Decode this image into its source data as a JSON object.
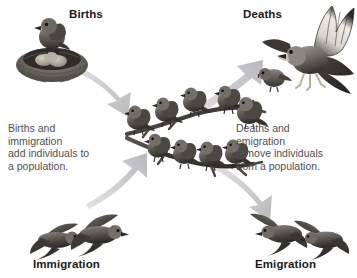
{
  "diagram": {
    "background_color": "#ffffff",
    "text_color": "#4f4f52",
    "heading_color": "#1a1a1a",
    "arrow_color": "#c6c6c8"
  },
  "labels": {
    "births": "Births",
    "deaths": "Deaths",
    "immigration": "Immigration",
    "emigration": "Emigration"
  },
  "captions": {
    "left": "Births and\nimmigration\nadd individuals to\na population.",
    "right": "Deaths and\nemigration\nremove individuals\nfrom a population."
  },
  "illustrations": {
    "births": "bird-on-nest-with-eggs-illustration",
    "deaths": "hawk-raptor-catching-bird-illustration",
    "immigration": "two-birds-flying-in-illustration",
    "emigration": "two-birds-flying-away-illustration",
    "population": "flock-of-sparrows-on-branches-illustration"
  },
  "population": {
    "upper_branch_bird_count": 5,
    "lower_branch_bird_count": 4
  },
  "arrows": [
    {
      "name": "births-to-population",
      "from": "births",
      "to": "population",
      "direction": "down-right"
    },
    {
      "name": "immigration-to-population",
      "from": "immigration",
      "to": "population",
      "direction": "up-right"
    },
    {
      "name": "population-to-deaths",
      "from": "population",
      "to": "deaths",
      "direction": "up-right"
    },
    {
      "name": "population-to-emigration",
      "from": "population",
      "to": "emigration",
      "direction": "down-right"
    }
  ]
}
